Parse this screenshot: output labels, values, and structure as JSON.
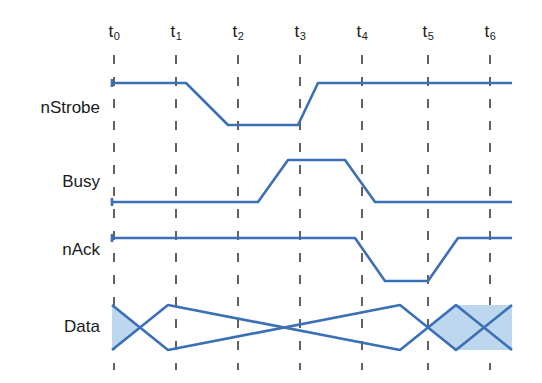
{
  "diagram": {
    "type": "timing-diagram",
    "colors": {
      "waveform_stroke": "#3b6fb6",
      "bus_fill": "#bdd7ee",
      "gridline": "#3a3a3a",
      "text": "#1a1a1a",
      "background": "#ffffff"
    },
    "canvas": {
      "width": 542,
      "height": 383
    },
    "time_markers": [
      {
        "name": "t0",
        "base": "t",
        "sub": "0",
        "x": 114
      },
      {
        "name": "t1",
        "base": "t",
        "sub": "1",
        "x": 176
      },
      {
        "name": "t2",
        "base": "t",
        "sub": "2",
        "x": 238
      },
      {
        "name": "t3",
        "base": "t",
        "sub": "3",
        "x": 300
      },
      {
        "name": "t4",
        "base": "t",
        "sub": "4",
        "x": 362
      },
      {
        "name": "t5",
        "base": "t",
        "sub": "5",
        "x": 428
      },
      {
        "name": "t6",
        "base": "t",
        "sub": "6",
        "x": 490
      }
    ],
    "marker_label_y": 33,
    "gridline_top": 55,
    "gridline_bottom": 370,
    "signals": [
      {
        "name": "nStrobe",
        "label": "nStrobe",
        "label_y": 108,
        "high_y": 83,
        "low_y": 125,
        "initial_level": "high",
        "transitions": [
          {
            "type": "fall",
            "start_x": 186,
            "end_x": 228
          },
          {
            "type": "rise",
            "start_x": 298,
            "end_x": 318
          }
        ],
        "start_x": 112,
        "end_x": 512
      },
      {
        "name": "Busy",
        "label": "Busy",
        "label_y": 182,
        "high_y": 160,
        "low_y": 202,
        "initial_level": "low",
        "transitions": [
          {
            "type": "rise",
            "start_x": 258,
            "end_x": 288
          },
          {
            "type": "fall",
            "start_x": 345,
            "end_x": 375
          }
        ],
        "start_x": 112,
        "end_x": 512
      },
      {
        "name": "nAck",
        "label": "nAck",
        "label_y": 250,
        "high_y": 238,
        "low_y": 281,
        "initial_level": "high",
        "transitions": [
          {
            "type": "fall",
            "start_x": 355,
            "end_x": 385
          },
          {
            "type": "rise",
            "start_x": 428,
            "end_x": 458
          }
        ],
        "start_x": 112,
        "end_x": 512
      },
      {
        "name": "Data",
        "label": "Data",
        "label_y": 327,
        "bus": true,
        "top_y": 305,
        "bottom_y": 350,
        "start_x": 112,
        "end_x": 512,
        "crossings": [
          {
            "center_x": 140,
            "half_width": 28
          },
          {
            "center_x": 428,
            "half_width": 28
          }
        ],
        "shaded_segments": [
          {
            "from_x": 112,
            "to_x": 140,
            "state": "invalid"
          },
          {
            "from_x": 428,
            "to_x": 512,
            "state": "invalid"
          }
        ],
        "valid_segments": [
          {
            "from_x": 140,
            "to_x": 428,
            "state": "valid"
          }
        ]
      }
    ]
  }
}
